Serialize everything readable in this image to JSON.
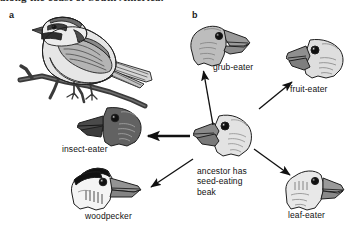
{
  "figure": {
    "caption_top": "along the coast of South America.",
    "background": "#ffffff"
  },
  "panels": [
    {
      "id": "a",
      "label": "a",
      "x": 9,
      "y": 11
    },
    {
      "id": "b",
      "label": "b",
      "x": 192,
      "y": 11
    }
  ],
  "panel_a": {
    "subject_name": "finch-on-branch-illustration",
    "description_alt": "ground finch perched on a branch"
  },
  "panel_b": {
    "diagram_type": "radiating-arrow-diagram",
    "center": {
      "name": "ancestor",
      "label": "ancestor has\nseed-eating\nbeak",
      "label_x": 197,
      "label_y": 168,
      "head_x": 193,
      "head_y": 112,
      "head_w": 62,
      "head_h": 46,
      "facing": "left",
      "head_color": "#e3e3e3",
      "beak_color": "#8a8a8a"
    },
    "nodes": [
      {
        "name": "grub-eater",
        "label": "grub-eater",
        "label_x": 213,
        "label_y": 64,
        "head_x": 186,
        "head_y": 22,
        "head_w": 64,
        "head_h": 44,
        "facing": "right",
        "head_color": "#bdbdbd",
        "beak_color": "#9a9a9a"
      },
      {
        "name": "fruit-eater",
        "label": "fruit-eater",
        "label_x": 291,
        "label_y": 85,
        "head_x": 286,
        "head_y": 36,
        "head_w": 60,
        "head_h": 44,
        "facing": "left",
        "head_color": "#dedede",
        "beak_color": "#8f8f8f"
      },
      {
        "name": "insect-eater",
        "label": "insect-eater",
        "label_x": 62,
        "label_y": 145,
        "head_x": 77,
        "head_y": 104,
        "head_w": 66,
        "head_h": 44,
        "facing": "left",
        "head_color": "#626262",
        "beak_color": "#4a4a4a"
      },
      {
        "name": "woodpecker",
        "label": "woodpecker",
        "label_x": 87,
        "label_y": 212,
        "head_x": 62,
        "head_y": 166,
        "head_w": 76,
        "head_h": 44,
        "facing": "right",
        "head_color": "#f4f4f4",
        "beak_color": "#949494",
        "crown_color": "#111111"
      },
      {
        "name": "leaf-eater",
        "label": "leaf-eater",
        "label_x": 290,
        "label_y": 211,
        "head_x": 281,
        "head_y": 168,
        "head_w": 62,
        "head_h": 42,
        "facing": "right",
        "head_color": "#e8e8e8",
        "beak_color": "#9a9a9a"
      }
    ],
    "arrows": [
      {
        "name": "arrow-to-grub-eater",
        "from": [
          213,
          125
        ],
        "to": [
          203,
          70
        ],
        "style": "thin"
      },
      {
        "name": "arrow-to-fruit-eater",
        "from": [
          258,
          108
        ],
        "to": [
          292,
          81
        ],
        "style": "thin"
      },
      {
        "name": "arrow-to-insect-eater",
        "from": [
          188,
          136
        ],
        "to": [
          146,
          136
        ],
        "style": "thick"
      },
      {
        "name": "arrow-to-woodpecker",
        "from": [
          192,
          160
        ],
        "to": [
          150,
          188
        ],
        "style": "thin"
      },
      {
        "name": "arrow-to-leaf-eater",
        "from": [
          253,
          148
        ],
        "to": [
          289,
          176
        ],
        "style": "thin"
      }
    ]
  },
  "colors": {
    "ink": "#111111",
    "outline": "#1f1f1f",
    "mid_gray": "#9a9a9a",
    "light_gray": "#e3e3e3",
    "dark_gray": "#5a5a5a"
  }
}
